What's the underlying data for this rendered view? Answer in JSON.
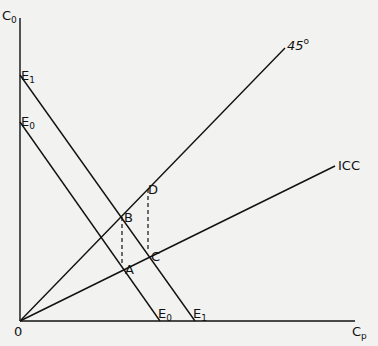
{
  "axes": {
    "y_label": "C",
    "y_label_sub": "0",
    "x_label": "C",
    "x_label_sub": "p",
    "origin_label": "0"
  },
  "lines": {
    "forty_five": {
      "label": "45",
      "degree": "o"
    },
    "icc": {
      "label": "ICC"
    },
    "budget_e0": {
      "top_label": "E",
      "top_sub": "0",
      "bottom_label": "E",
      "bottom_sub": "0"
    },
    "budget_e1": {
      "top_label": "E",
      "top_sub": "1",
      "bottom_label": "E",
      "bottom_sub": "1"
    }
  },
  "points": {
    "A": "A",
    "B": "B",
    "C": "C",
    "D": "D"
  }
}
